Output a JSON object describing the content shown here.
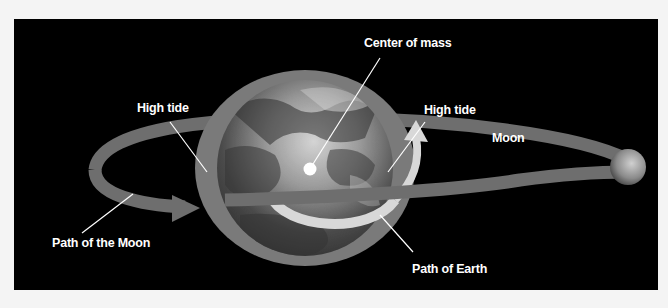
{
  "labels": {
    "center_of_mass": "Center of mass",
    "high_tide_left": "High tide",
    "high_tide_right": "High tide",
    "moon": "Moon",
    "path_of_moon": "Path of the Moon",
    "path_of_earth": "Path of Earth"
  },
  "colors": {
    "background": "#000000",
    "page": "#f4f4f4",
    "orbit_band": "#6e6e6e",
    "tidal_bulge": "#7a7a7a",
    "earth_path": "#d8d8d8",
    "label_text": "#ffffff",
    "leader_line": "#ffffff"
  }
}
